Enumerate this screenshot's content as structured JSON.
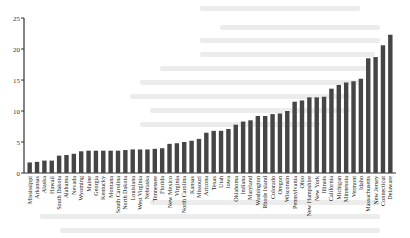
{
  "chart_data": {
    "type": "bar",
    "title": "",
    "xlabel": "",
    "ylabel": "",
    "ylim": [
      0,
      25
    ],
    "yticks": [
      0,
      5,
      10,
      15,
      20,
      25
    ],
    "grid": false,
    "legend": null,
    "bar_color": "#454545",
    "categories": [
      "Mississippi",
      "Arkansas",
      "Alaska",
      "Hawaii",
      "South Dakota",
      "Alabama",
      "Nevada",
      "Wyoming",
      "Maine",
      "Georgia",
      "Kentucky",
      "Montana",
      "South Carolina",
      "North Dakota",
      "Louisiana",
      "West Virginia",
      "Nebraska",
      "Tennessee",
      "Florida",
      "New Mexico",
      "Virginia",
      "North Carolina",
      "Kansas",
      "Missouri",
      "Arizona",
      "Texas",
      "Utah",
      "Iowa",
      "Oklahoma",
      "Indiana",
      "Maryland",
      "Washington",
      "Rhode Island",
      "Colorado",
      "Oregon",
      "Wisconsin",
      "Pennsylvania",
      "Ohio",
      "New Hampshire",
      "New York",
      "Illinois",
      "California",
      "Michigan",
      "Minnesota",
      "Vermont",
      "Idaho",
      "Massachusetts",
      "New Jersey",
      "Connecticut",
      "Delaware"
    ],
    "values": [
      1.7,
      1.8,
      2.0,
      2.0,
      2.8,
      2.9,
      3.1,
      3.5,
      3.6,
      3.6,
      3.6,
      3.6,
      3.6,
      3.7,
      3.8,
      3.8,
      3.8,
      3.9,
      4.0,
      4.7,
      4.8,
      5.0,
      5.2,
      5.5,
      6.5,
      6.8,
      6.8,
      7.1,
      7.8,
      8.3,
      8.5,
      9.2,
      9.2,
      9.5,
      9.6,
      10.0,
      11.5,
      11.7,
      12.2,
      12.2,
      12.3,
      13.6,
      14.2,
      14.6,
      14.8,
      15.2,
      18.5,
      18.7,
      20.6,
      22.3
    ]
  }
}
